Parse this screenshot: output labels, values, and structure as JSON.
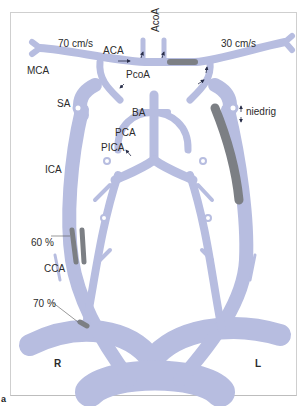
{
  "figure": {
    "panel_label": "a",
    "colors": {
      "vessel": "#b7bde0",
      "stenosis": "#7c7f84",
      "arrow": "#2a2f4a",
      "frame": "#cfcfcf"
    }
  },
  "labels": {
    "velocity_right": "70 cm/s",
    "velocity_left": "30 cm/s",
    "mca": "MCA",
    "aca": "ACA",
    "acoa": "AcoA",
    "pcoa": "PcoA",
    "sa": "SA",
    "ba": "BA",
    "pca": "PCA",
    "pica": "PICA",
    "ica": "ICA",
    "cca": "CCA",
    "stenosis_60": "60 %",
    "stenosis_70": "70 %",
    "niedrig": "niedrig",
    "side_right": "R",
    "side_left": "L"
  }
}
